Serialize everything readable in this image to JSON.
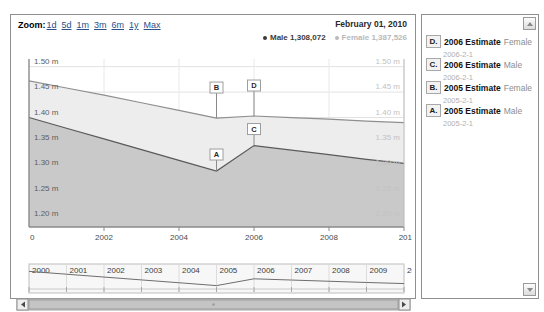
{
  "range_selector": {
    "label": "Zoom:",
    "buttons": [
      "1d",
      "5d",
      "1m",
      "3m",
      "6m",
      "1y",
      "Max"
    ]
  },
  "chart_header": {
    "date": "February 01, 2010",
    "legend": [
      {
        "name": "Male",
        "value": "1,308,072",
        "color": "#3b3b3b"
      },
      {
        "name": "Female",
        "value": "1,387,526",
        "color": "#b9b9b9"
      }
    ]
  },
  "sidebar": {
    "scroll_up_icon": "triangle-up-icon",
    "scroll_down_icon": "triangle-down-icon",
    "items": [
      {
        "badge": "D.",
        "title": "2006 Estimate",
        "series": "Female",
        "date": "2006-2-1"
      },
      {
        "badge": "C.",
        "title": "2006 Estimate",
        "series": "Male",
        "date": "2006-2-1"
      },
      {
        "badge": "B.",
        "title": "2005 Estimate",
        "series": "Female",
        "date": "2005-2-1"
      },
      {
        "badge": "A.",
        "title": "2005 Estimate",
        "series": "Male",
        "date": "2005-2-1"
      }
    ]
  },
  "navigator": {
    "years": [
      "2000",
      "2001",
      "2002",
      "2003",
      "2004",
      "2005",
      "2006",
      "2007",
      "2008",
      "2009",
      "20"
    ],
    "left_arrow_icon": "chevron-left-icon",
    "right_arrow_icon": "chevron-right-icon"
  },
  "chart_data": {
    "type": "area",
    "title": "",
    "subtitle": "",
    "xlabel": "",
    "ylabel": "",
    "grid": true,
    "legend_position": "top-right",
    "x": [
      2000,
      2001,
      2002,
      2003,
      2004,
      2005,
      2006,
      2007,
      2008,
      2009,
      2010
    ],
    "x_tick_labels": [
      "0",
      "2002",
      "2004",
      "2006",
      "2008",
      "201"
    ],
    "y_tick_labels": [
      "1.50 m",
      "1.45 m",
      "1.40 m",
      "1.35 m",
      "1.30 m",
      "1.25 m",
      "1.20 m"
    ],
    "y_tick_values": [
      1.5,
      1.45,
      1.4,
      1.35,
      1.3,
      1.25,
      1.2
    ],
    "ylim": [
      1.185,
      1.515
    ],
    "xlim": [
      2000,
      2010
    ],
    "series": [
      {
        "name": "Female",
        "color": "#8f8f8f",
        "fill": "#ededed",
        "values": [
          1.472,
          1.458,
          1.444,
          1.429,
          1.414,
          1.399,
          1.403,
          1.4,
          1.397,
          1.393,
          1.39
        ]
      },
      {
        "name": "Male",
        "color": "#5a5a5a",
        "fill": "#c9c9c9",
        "values": [
          1.4,
          1.379,
          1.358,
          1.337,
          1.316,
          1.295,
          1.345,
          1.336,
          1.327,
          1.318,
          1.31
        ]
      }
    ],
    "flags": [
      {
        "label": "A",
        "x": 2005,
        "series": "Male",
        "value": 1.295
      },
      {
        "label": "B",
        "x": 2005,
        "series": "Female",
        "value": 1.399
      },
      {
        "label": "C",
        "x": 2006,
        "series": "Male",
        "value": 1.345
      },
      {
        "label": "D",
        "x": 2006,
        "series": "Female",
        "value": 1.403
      }
    ],
    "navigator_series": {
      "name": "Male",
      "x": [
        2000,
        2001,
        2002,
        2003,
        2004,
        2005,
        2006,
        2007,
        2008,
        2009,
        2010
      ],
      "values": [
        1.4,
        1.379,
        1.358,
        1.337,
        1.316,
        1.295,
        1.345,
        1.336,
        1.327,
        1.318,
        1.31
      ]
    }
  }
}
